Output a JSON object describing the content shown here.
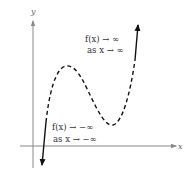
{
  "axes": {
    "x_label": "x",
    "y_label": "y"
  },
  "annotations": {
    "top": {
      "line1": "f(x) → ∞",
      "line2": "as x → ∞"
    },
    "bottom": {
      "line1": "f(x) → −∞",
      "line2": "as x → −∞"
    }
  },
  "colors": {
    "axis": "#888888",
    "curve": "#111111",
    "text": "#333333"
  },
  "curve": {
    "type": "cubic-polynomial-sketch",
    "style": "dashed middle, solid arrowed ends",
    "local_max": "left hump",
    "local_min": "right valley",
    "end_behavior_left": "down",
    "end_behavior_right": "up"
  }
}
